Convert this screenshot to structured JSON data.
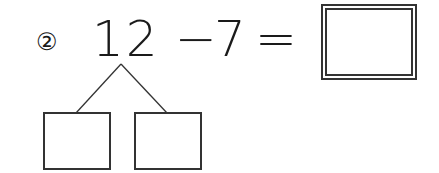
{
  "problem": {
    "number_label": "②",
    "minuend": "12",
    "operator": "−",
    "subtrahend": "7",
    "equals": "=",
    "answer_value": "",
    "decomposition": {
      "left_part": "",
      "right_part": ""
    }
  },
  "colors": {
    "stroke": "#333333",
    "text": "#1a1a1a",
    "background": "#ffffff"
  }
}
